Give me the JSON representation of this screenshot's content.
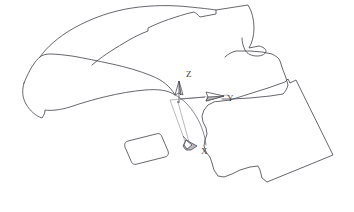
{
  "app": {
    "window_title": "CAD Viewport",
    "background_color": "#ffffff",
    "line_color": "#55555c"
  },
  "viewport": {
    "width": 354,
    "height": 212,
    "label": "3D wireframe viewport"
  },
  "axis_triad": {
    "name": "coordinate-axis-triad",
    "origin": {
      "x": 178,
      "y": 102
    },
    "axes": [
      {
        "id": "z",
        "label": "Z",
        "label_x": 186,
        "label_y": 76,
        "direction": "up",
        "arrow_tip": {
          "x": 179,
          "y": 82
        },
        "color": "#4a4a52"
      },
      {
        "id": "y",
        "label": "Y",
        "label_x": 228,
        "label_y": 101,
        "direction": "right",
        "arrow_tip": {
          "x": 222,
          "y": 97
        },
        "color": "#4a4a52"
      },
      {
        "id": "x",
        "label": "X",
        "label_x": 202,
        "label_y": 153,
        "direction": "down-left",
        "arrow_tip": {
          "x": 190,
          "y": 146
        },
        "color": "#4a4a52"
      }
    ]
  },
  "shapes": [
    {
      "name": "left-tapered-surface-patch",
      "description": "Elongated tapered wing-like surface outline on the left",
      "path": "M 24 83 C 22 90 22 97 26 104 C 30 111 36 116 42 118 C 44 115 45 113 45 110 C 51 111 60 110 70 107 C 90 100 120 92 145 90 C 158 89 168 90 175 95 C 170 86 162 80 152 76 C 140 71 126 67 112 64 C 98 61 84 58 72 56 C 64 55 56 54 50 54 C 46 54 42 55 40 57 C 36 60 30 68 24 83 Z"
    },
    {
      "name": "upper-right-surface-patch",
      "description": "Upper right irregular surface outline with notch",
      "path": "M 40 57 C 46 48 58 37 74 28 C 92 18 112 11 132 8 C 152 5 172 5 190 7 C 200 8 210 9 216 10 L 216 14 C 211 15 205 16 200 17 C 198 15 196 13 194 12 C 189 13 182 15 176 17 C 166 20 156 24 148 28 L 148 31 C 140 34 132 38 124 43 C 112 50 100 58 92 65"
    },
    {
      "name": "top-right-notch-detail",
      "description": "Small pointed notch at upper right of top patch",
      "path": "M 216 10 L 248 5 C 252 11 254 20 254 28 C 254 36 252 43 249 48 L 259 46 C 263 47 266 49 266 51 C 266 54 262 56 257 56 C 252 56 247 54 245 50 C 243 46 242 42 242 38"
    },
    {
      "name": "mid-right-surface-patch",
      "description": "Middle right surface patch outline connecting to the large quad",
      "path": "M 225 57 C 228 54 232 52 236 51 L 250 51 L 262 52 L 272 54 C 276 56 279 58 280 61 L 283 70 L 286 78 L 288 85 C 287 89 285 92 283 94 L 270 96 L 250 98 L 232 99 L 222 99"
    },
    {
      "name": "right-large-quad-patch",
      "description": "Large rotated quadrilateral surface patch on the right with irregular lower-left edge",
      "path": "M 230 100 L 268 88 L 285 82 L 288 79 L 290 83 L 296 80 L 333 155 L 267 182 L 262 178 L 260 170 L 258 166 L 250 167 L 240 170 L 232 174 L 224 177 L 218 176 L 214 170 L 212 163 L 210 157 L 206 152 L 204 146 L 205 140 L 207 134 L 206 128 L 203 122 L 202 116 L 204 110 L 208 105 L 214 102 Z"
    },
    {
      "name": "center-rounded-rectangle-patch",
      "description": "Small rounded rectangular surface patch near lower center",
      "path": "M 125 147 C 124 144 125 142 128 141 L 156 134 C 159 133 161 134 162 137 L 168 151 C 169 154 168 156 165 157 L 137 164 C 134 165 132 164 131 161 Z"
    },
    {
      "name": "center-curve-connector",
      "description": "Curved edge passing through the origin region",
      "path": "M 175 95 C 182 98 190 106 196 116 C 202 126 205 136 206 145"
    }
  ],
  "annotations": {
    "origin_marker": "axis-origin-point"
  }
}
